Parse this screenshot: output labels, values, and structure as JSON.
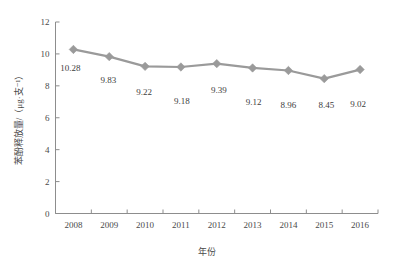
{
  "chart_data": {
    "type": "line",
    "title": "",
    "xlabel": "年份",
    "ylabel": "苯酚释放量/（μg·支⁻¹）",
    "categories": [
      "2008",
      "2009",
      "2010",
      "2011",
      "2012",
      "2013",
      "2014",
      "2015",
      "2016"
    ],
    "values": [
      10.28,
      9.83,
      9.22,
      9.18,
      9.39,
      9.12,
      8.96,
      8.45,
      9.02
    ],
    "data_labels": [
      "10.28",
      "9.83",
      "9.22",
      "9.18",
      "9.39",
      "9.12",
      "8.96",
      "8.45",
      "9.02"
    ],
    "yticks": [
      "0",
      "2",
      "4",
      "6",
      "8",
      "10",
      "12"
    ],
    "ytick_values": [
      0,
      2,
      4,
      6,
      8,
      10,
      12
    ],
    "ylim": [
      0,
      12
    ],
    "grid": false,
    "legend": "none",
    "series_color": "#9a9a9a",
    "marker": "diamond",
    "axis_color": "#8d8d8d",
    "series": [
      {
        "name": "苯酚释放量",
        "values": [
          10.28,
          9.83,
          9.22,
          9.18,
          9.39,
          9.12,
          8.96,
          8.45,
          9.02
        ]
      }
    ]
  }
}
